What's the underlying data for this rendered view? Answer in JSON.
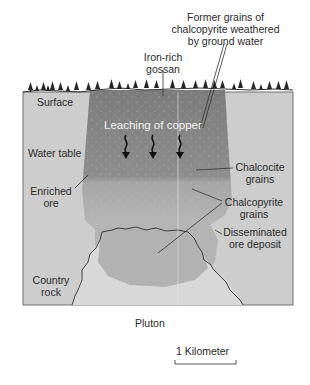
{
  "diagram": {
    "colors": {
      "country_rock": "#cfcfcf",
      "gossan_leached_zone": "#8a8a8a",
      "enriched_ore": "#a8a8a8",
      "disseminated_ore": "#b6b6b6",
      "pluton": "#d9d9d9",
      "outline": "#333333",
      "trees": "#2b2b2b",
      "background": "#ffffff"
    },
    "labels": {
      "former_grains": [
        "Former grains of",
        "chalcopyrite weathered",
        "by ground water"
      ],
      "gossan": [
        "Iron-rich",
        "gossan"
      ],
      "surface": "Surface",
      "leaching": "Leaching of copper",
      "water_table": "Water table",
      "chalcocite": [
        "Chalcocite",
        "grains"
      ],
      "enriched_ore": [
        "Enriched",
        "ore"
      ],
      "chalcopyrite": [
        "Chalcopyrite",
        "grains"
      ],
      "disseminated": [
        "Disseminated",
        "ore deposit"
      ],
      "country_rock": [
        "Country",
        "rock"
      ],
      "pluton": "Pluton",
      "scale": "1 Kilometer"
    },
    "arrows": {
      "count": 3,
      "direction": "down",
      "meaning": "leaching of copper"
    }
  }
}
